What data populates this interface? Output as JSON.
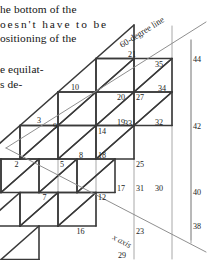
{
  "document": {
    "paragraphs": [
      {
        "lines": [
          "he bottom of the",
          "oesn't have to be",
          "ositioning of the"
        ]
      },
      {
        "lines": [
          "e equilat-",
          "s de-"
        ]
      }
    ]
  },
  "figure": {
    "axis_labels": {
      "diagonal_top": "60-degree line",
      "diagonal_bottom": "x axis"
    },
    "vertex_numbers": [
      "2",
      "3",
      "5",
      "7",
      "8",
      "9",
      "10",
      "12",
      "14",
      "16",
      "17",
      "18",
      "19",
      "20",
      "21",
      "23",
      "25",
      "27",
      "29",
      "30",
      "31",
      "32",
      "33",
      "34",
      "35",
      "38",
      "40",
      "42",
      "44"
    ],
    "nodes": [
      {
        "id": "2",
        "x": 20,
        "y": 159,
        "anchor": "end",
        "dx": -1.5,
        "dy": 7.5
      },
      {
        "id": "3",
        "x": 39,
        "y": 125,
        "anchor": "middle",
        "dx": 0,
        "dy": -2.5
      },
      {
        "id": "5",
        "x": 58,
        "y": 159,
        "anchor": "start",
        "dx": 2.0,
        "dy": 8.0
      },
      {
        "id": "7",
        "x": 48,
        "y": 192,
        "anchor": "end",
        "dx": -1.5,
        "dy": 8.0
      },
      {
        "id": "8",
        "x": 77,
        "y": 159,
        "anchor": "start",
        "dx": 2.0,
        "dy": -1.5
      },
      {
        "id": "9",
        "x": 58,
        "y": 126,
        "anchor": "end",
        "dx": -1.0,
        "dy": 3.0
      },
      {
        "id": "10",
        "x": 77,
        "y": 92,
        "anchor": "middle",
        "dx": -2.0,
        "dy": -2.5
      },
      {
        "id": "12",
        "x": 96,
        "y": 192,
        "anchor": "start",
        "dx": 2.0,
        "dy": 8.0
      },
      {
        "id": "14",
        "x": 96,
        "y": 126,
        "anchor": "start",
        "dx": 2.0,
        "dy": 8.0
      },
      {
        "id": "16",
        "x": 86,
        "y": 226,
        "anchor": "end",
        "dx": -1.5,
        "dy": 8.0
      },
      {
        "id": "17",
        "x": 115,
        "y": 192,
        "anchor": "start",
        "dx": 2.0,
        "dy": -1.5
      },
      {
        "id": "18",
        "x": 96,
        "y": 159,
        "anchor": "start",
        "dx": 2.0,
        "dy": -1.5
      },
      {
        "id": "19",
        "x": 115,
        "y": 126,
        "anchor": "start",
        "dx": 2.0,
        "dy": -1.5
      },
      {
        "id": "20",
        "x": 115,
        "y": 92,
        "anchor": "start",
        "dx": 2.0,
        "dy": 8.0
      },
      {
        "id": "21",
        "x": 134,
        "y": 59,
        "anchor": "middle",
        "dx": -2.0,
        "dy": -2.5
      },
      {
        "id": "23",
        "x": 134,
        "y": 226,
        "anchor": "start",
        "dx": 2.0,
        "dy": 8.0
      },
      {
        "id": "25",
        "x": 134,
        "y": 159,
        "anchor": "start",
        "dx": 2.0,
        "dy": 8.0
      },
      {
        "id": "27",
        "x": 134,
        "y": 92,
        "anchor": "start",
        "dx": 2.0,
        "dy": 8.0
      },
      {
        "id": "29",
        "x": 124,
        "y": 259,
        "anchor": "end",
        "dx": 2.0,
        "dy": -1.5
      },
      {
        "id": "30",
        "x": 153,
        "y": 192,
        "anchor": "start",
        "dx": 2.0,
        "dy": -1.5
      },
      {
        "id": "31",
        "x": 134,
        "y": 192,
        "anchor": "start",
        "dx": 2.0,
        "dy": -1.5
      },
      {
        "id": "32",
        "x": 153,
        "y": 126,
        "anchor": "start",
        "dx": 2.0,
        "dy": -1.5
      },
      {
        "id": "33",
        "x": 153,
        "y": 126,
        "anchor": "end",
        "dx": -21,
        "dy": 0.0
      },
      {
        "id": "34",
        "x": 172,
        "y": 92,
        "anchor": "start",
        "dx": -14,
        "dy": -1.5
      },
      {
        "id": "35",
        "x": 153,
        "y": 59,
        "anchor": "start",
        "dx": 2.0,
        "dy": 8.0
      },
      {
        "id": "38",
        "x": 191,
        "y": 226,
        "anchor": "start",
        "dx": 2.0,
        "dy": 3.0
      },
      {
        "id": "40",
        "x": 191,
        "y": 192,
        "anchor": "start",
        "dx": 2.0,
        "dy": 3.0
      },
      {
        "id": "42",
        "x": 191,
        "y": 126,
        "anchor": "start",
        "dx": 2.0,
        "dy": 3.0
      },
      {
        "id": "44",
        "x": 191,
        "y": 59,
        "anchor": "start",
        "dx": 2.0,
        "dy": 3.0
      }
    ],
    "colors": {
      "triangle_stroke": "#3a3a3a",
      "grid_line": "#9a9a9a",
      "boundary_line": "#8a8a8a",
      "background": "#ffffff"
    }
  }
}
